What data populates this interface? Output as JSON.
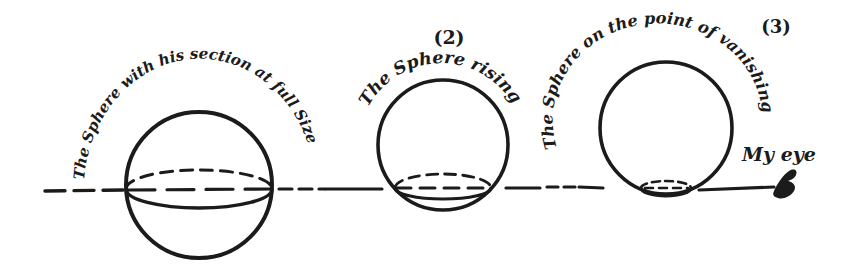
{
  "figure": {
    "background_color": "#ffffff",
    "ink_color": "#1b1b1b",
    "stages": [
      {
        "marker": "",
        "caption": "The Sphere with his section at full Size"
      },
      {
        "marker": "(2)",
        "caption": "The Sphere rising"
      },
      {
        "marker": "(3)",
        "caption": "The Sphere on the point of vanishing"
      }
    ],
    "eye_label": "My eye",
    "icons": {
      "observer_eye": "eye-icon"
    }
  }
}
